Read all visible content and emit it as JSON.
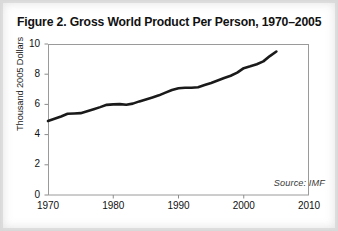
{
  "figure": {
    "title": "Figure 2. Gross World Product Per Person, 1970–2005",
    "source_note": "Source: IMF"
  },
  "colors": {
    "page_background": "#ffffff",
    "page_border": "#d9d9d9",
    "line": "#1a1a1a",
    "axis": "#888888",
    "text": "#111111",
    "source_text": "#3a3a3a"
  },
  "chart_data": {
    "type": "line",
    "title": "Figure 2. Gross World Product Per Person, 1970–2005",
    "xlabel": "",
    "ylabel": "Thousand 2005 Dollars",
    "xlim": [
      1970,
      2010
    ],
    "ylim": [
      0,
      10
    ],
    "xticks": [
      1970,
      1980,
      1990,
      2000,
      2010
    ],
    "xtick_labels": [
      "1970",
      "1980",
      "1990",
      "2000",
      "2010"
    ],
    "yticks": [
      0,
      2,
      4,
      6,
      8,
      10
    ],
    "ytick_labels": [
      "0",
      "2",
      "4",
      "6",
      "8",
      "10"
    ],
    "grid": false,
    "legend": false,
    "annotations": [
      {
        "text": "Source: IMF",
        "position": "bottom-right-inside-plot",
        "style": "italic"
      }
    ],
    "x": [
      1970,
      1971,
      1972,
      1973,
      1974,
      1975,
      1976,
      1977,
      1978,
      1979,
      1980,
      1981,
      1982,
      1983,
      1984,
      1985,
      1986,
      1987,
      1988,
      1989,
      1990,
      1991,
      1992,
      1993,
      1994,
      1995,
      1996,
      1997,
      1998,
      1999,
      2000,
      2001,
      2002,
      2003,
      2004,
      2005
    ],
    "values": [
      4.9,
      5.05,
      5.2,
      5.38,
      5.4,
      5.42,
      5.55,
      5.68,
      5.82,
      5.97,
      6.0,
      6.02,
      5.98,
      6.05,
      6.2,
      6.33,
      6.46,
      6.6,
      6.78,
      6.95,
      7.07,
      7.1,
      7.1,
      7.14,
      7.28,
      7.42,
      7.58,
      7.75,
      7.9,
      8.1,
      8.4,
      8.52,
      8.66,
      8.85,
      9.2,
      9.5
    ],
    "series": [
      {
        "name": "Gross World Product Per Person",
        "unit": "Thousand 2005 Dollars",
        "values": [
          4.9,
          5.05,
          5.2,
          5.38,
          5.4,
          5.42,
          5.55,
          5.68,
          5.82,
          5.97,
          6.0,
          6.02,
          5.98,
          6.05,
          6.2,
          6.33,
          6.46,
          6.6,
          6.78,
          6.95,
          7.07,
          7.1,
          7.1,
          7.14,
          7.28,
          7.42,
          7.58,
          7.75,
          7.9,
          8.1,
          8.4,
          8.52,
          8.66,
          8.85,
          9.2,
          9.5
        ]
      }
    ]
  },
  "axis_geometry": {
    "plot_left_px": 47,
    "plot_right_px": 308,
    "plot_top_px": 43,
    "plot_bottom_px": 194
  }
}
